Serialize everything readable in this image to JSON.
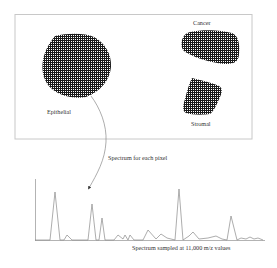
{
  "diagram": {
    "tissue_panel": {
      "regions": [
        {
          "id": "epithelial",
          "label": "Epithelial"
        },
        {
          "id": "cancer",
          "label": "Cancer"
        },
        {
          "id": "stromal",
          "label": "Stromal"
        }
      ]
    },
    "arrow_label": "Spectrum for each pixel",
    "spectrum_caption": "Spectrum sampled at 11,000 m/z values"
  },
  "colors": {
    "border": "#c8c8c8",
    "hatch_dark": "#1a1a1a",
    "spectrum_line": "#8a8a8a",
    "arrow": "#8a8a8a",
    "text": "#333333"
  }
}
